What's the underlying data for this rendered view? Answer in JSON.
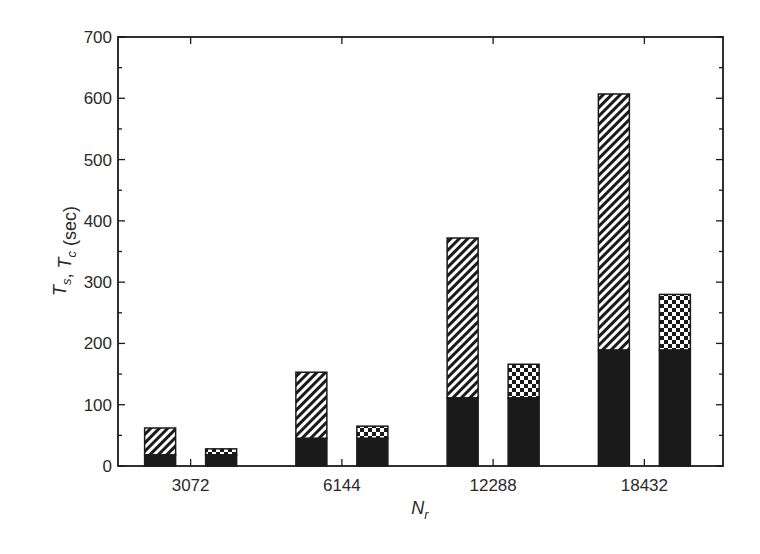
{
  "chart_data": {
    "type": "bar",
    "subtype": "grouped-stacked",
    "title": "",
    "xlabel": "N_r",
    "ylabel": "T_s, T_c (sec)",
    "ylim": [
      0,
      700
    ],
    "yticks": [
      0,
      100,
      200,
      300,
      400,
      500,
      600,
      700
    ],
    "yminor_step": 50,
    "grid": false,
    "legend": null,
    "categories": [
      "3072",
      "6144",
      "12288",
      "18432"
    ],
    "series": [
      {
        "name": "T_s",
        "pattern": "diagonal-hatch",
        "total": [
          62,
          153,
          372,
          607
        ],
        "solid_base": [
          18,
          45,
          111,
          189
        ]
      },
      {
        "name": "T_c",
        "pattern": "checkerboard",
        "total": [
          28,
          65,
          166,
          280
        ],
        "solid_base": [
          18,
          45,
          111,
          189
        ]
      }
    ]
  },
  "axes": {
    "x_label_main": "N",
    "x_label_sub": "r",
    "y_label_parts": [
      {
        "text": "T",
        "sub": "s",
        "italic": true
      },
      {
        "text": ", ",
        "sub": "",
        "italic": false
      },
      {
        "text": "T",
        "sub": "c",
        "italic": true
      },
      {
        "text": " (sec)",
        "sub": "",
        "italic": false
      }
    ]
  },
  "colors": {
    "ink": "#1a1a1a",
    "background": "#ffffff"
  }
}
